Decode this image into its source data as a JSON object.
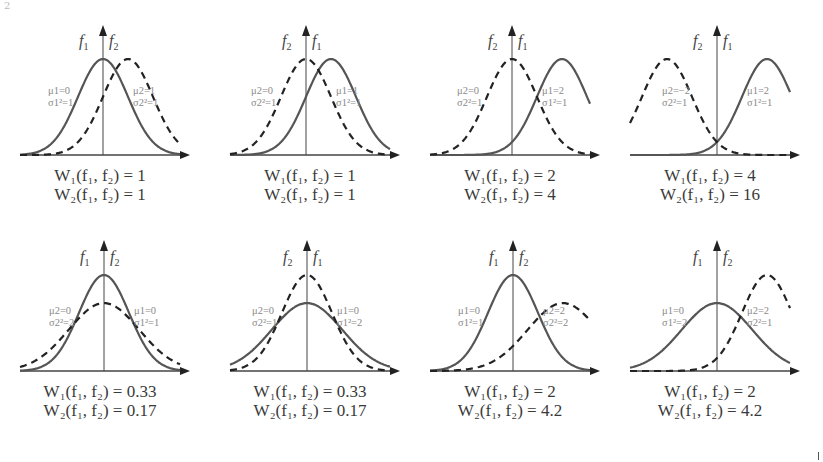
{
  "figure": {
    "top_mark": "2",
    "colors": {
      "f1_line": "#555555",
      "f2_line": "#222222",
      "axis": "#444444",
      "param_text": "#8a8a8a"
    }
  },
  "panels": [
    {
      "id": "p1",
      "f1": {
        "mu": "0",
        "var": "1",
        "style": "solid"
      },
      "f2": {
        "mu": "1",
        "var": "1",
        "style": "dashed"
      },
      "left_label": "f1",
      "right_label": "f2",
      "left_param": {
        "mu": "μ1=0",
        "var": "σ1²=1"
      },
      "right_param": {
        "mu": "μ2=1",
        "var": "σ2²=1"
      },
      "w1": "1",
      "w2": "1"
    },
    {
      "id": "p2",
      "f1": {
        "mu": "1",
        "var": "1",
        "style": "solid"
      },
      "f2": {
        "mu": "0",
        "var": "1",
        "style": "dashed"
      },
      "left_label": "f2",
      "right_label": "f1",
      "left_param": {
        "mu": "μ2=0",
        "var": "σ2²=1"
      },
      "right_param": {
        "mu": "μ1=1",
        "var": "σ1²=1"
      },
      "w1": "1",
      "w2": "1"
    },
    {
      "id": "p3",
      "f1": {
        "mu": "2",
        "var": "1",
        "style": "solid"
      },
      "f2": {
        "mu": "0",
        "var": "1",
        "style": "dashed"
      },
      "left_label": "f2",
      "right_label": "f1",
      "left_param": {
        "mu": "μ2=0",
        "var": "σ2²=1"
      },
      "right_param": {
        "mu": "μ1=2",
        "var": "σ1²=1"
      },
      "w1": "2",
      "w2": "4"
    },
    {
      "id": "p4",
      "f1": {
        "mu": "2",
        "var": "1",
        "style": "solid"
      },
      "f2": {
        "mu": "-2",
        "var": "1",
        "style": "dashed"
      },
      "left_label": "f2",
      "right_label": "f1",
      "left_param": {
        "mu": "μ2=−2",
        "var": "σ2²=1"
      },
      "right_param": {
        "mu": "μ1=2",
        "var": "σ1²=1"
      },
      "w1": "4",
      "w2": "16"
    },
    {
      "id": "p5",
      "f1": {
        "mu": "0",
        "var": "1",
        "style": "solid"
      },
      "f2": {
        "mu": "0",
        "var": "2",
        "style": "dashed"
      },
      "left_label": "f1",
      "right_label": "f2",
      "left_param": {
        "mu": "μ2=0",
        "var": "σ2²=2"
      },
      "right_param": {
        "mu": "μ1=0",
        "var": "σ1²=1"
      },
      "w1": "0.33",
      "w2": "0.17"
    },
    {
      "id": "p6",
      "f1": {
        "mu": "0",
        "var": "2",
        "style": "solid"
      },
      "f2": {
        "mu": "0",
        "var": "1",
        "style": "dashed"
      },
      "left_label": "f2",
      "right_label": "f1",
      "left_param": {
        "mu": "μ2=0",
        "var": "σ2²=1"
      },
      "right_param": {
        "mu": "μ1=0",
        "var": "σ1²=2"
      },
      "w1": "0.33",
      "w2": "0.17"
    },
    {
      "id": "p7",
      "f1": {
        "mu": "0",
        "var": "1",
        "style": "solid"
      },
      "f2": {
        "mu": "2",
        "var": "2",
        "style": "dashed"
      },
      "left_label": "f1",
      "right_label": "f2",
      "left_param": {
        "mu": "μ1=0",
        "var": "σ1²=1"
      },
      "right_param": {
        "mu": "μ2=2",
        "var": "σ2²=2"
      },
      "w1": "2",
      "w2": "4.2"
    },
    {
      "id": "p8",
      "f1": {
        "mu": "0",
        "var": "2",
        "style": "solid"
      },
      "f2": {
        "mu": "2",
        "var": "1",
        "style": "dashed"
      },
      "left_label": "f1",
      "right_label": "f2",
      "left_param": {
        "mu": "μ1=0",
        "var": "σ1²=2"
      },
      "right_param": {
        "mu": "μ2=2",
        "var": "σ2²=1"
      },
      "w1": "2",
      "w2": "4.2"
    }
  ],
  "labels": {
    "w1_prefix": "W₁(f₁, f₂) = ",
    "w2_prefix": "W₂(f₁, f₂) = "
  }
}
